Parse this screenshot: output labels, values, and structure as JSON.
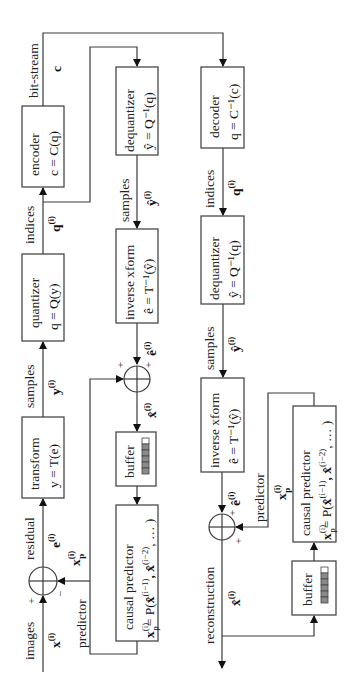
{
  "encoder": {
    "input": {
      "label": "images",
      "symbol": "x",
      "sup": "(i)"
    },
    "sum": {
      "plus": "+",
      "minus": "−"
    },
    "residual": {
      "label": "residual",
      "symbol": "e",
      "sup": "(i)"
    },
    "transform": {
      "title": "transform",
      "eq": "y = T(e)"
    },
    "samples": {
      "label": "samples",
      "symbol": "y",
      "sup": "(i)"
    },
    "quantizer": {
      "title": "quantizer",
      "eq": "q = Q(y)"
    },
    "indices": {
      "label": "indices",
      "symbol": "q",
      "sup": "(i)"
    },
    "encoder_box": {
      "title": "encoder",
      "eq": "c = C(q)"
    },
    "bitstream": {
      "label": "bit-stream",
      "symbol": "c"
    },
    "dequantizer": {
      "title": "dequantizer",
      "eq": "ŷ = Q⁻¹(q)"
    },
    "dq_samples": {
      "label": "samples",
      "symbol": "ŷ",
      "sup": "(i)"
    },
    "inverse": {
      "title": "inverse xform",
      "eq": "ê = T⁻¹(ŷ)"
    },
    "inv_out": {
      "symbol": "ê",
      "sup": "(i)"
    },
    "sum2": {
      "plus_a": "+",
      "plus_b": "+"
    },
    "recon": {
      "symbol": "x̂",
      "sup": "(i)"
    },
    "buffer": {
      "title": "buffer"
    },
    "predictor_box": {
      "title": "causal predictor",
      "eq": "x_p = P(x̂, x̂, …)",
      "eq_lhs": "x",
      "eq_lhs_sup": "(i)",
      "eq_lhs_sub": "p",
      "eq_rhs": "= P(",
      "arg1": "x̂",
      "arg1_sup": "(i−1)",
      "arg2": ", x̂",
      "arg2_sup": "(i−2)",
      "tail": ", … )"
    },
    "predictor": {
      "label": "predictor",
      "symbol": "x",
      "sub": "p",
      "sup": "(i)"
    }
  },
  "decoder": {
    "decoder_box": {
      "title": "decoder",
      "eq": "q = C⁻¹(c)"
    },
    "indices": {
      "label": "indices",
      "symbol": "q",
      "sup": "(i)"
    },
    "dequantizer": {
      "title": "dequantizer",
      "eq": "ŷ = Q⁻¹(q)"
    },
    "samples": {
      "label": "samples",
      "symbol": "ŷ",
      "sup": "(i)"
    },
    "inverse": {
      "title": "inverse xform",
      "eq": "ê = T⁻¹(ŷ)"
    },
    "inv_out": {
      "symbol": "ê",
      "sup": "(i)"
    },
    "sum": {
      "plus_a": "+",
      "plus_b": "+"
    },
    "predictor": {
      "label": "predictor",
      "symbol": "x",
      "sub": "p",
      "sup": "(i)"
    },
    "predictor_box": {
      "title": "causal predictor",
      "eq_lhs": "x",
      "eq_lhs_sup": "(i)",
      "eq_lhs_sub": "p",
      "eq_rhs": "= P(",
      "arg1": "x̂",
      "arg1_sup": "(i−1)",
      "arg2": ", x̂",
      "arg2_sup": "(i−2)",
      "tail": ", … )"
    },
    "buffer": {
      "title": "buffer"
    },
    "output": {
      "label": "reconstruction",
      "symbol": "x̂",
      "sup": "(i)"
    }
  },
  "colors": {
    "line": "#3a3a3a",
    "cell_fill": "#8a8a8a",
    "cell_empty": "#ffffff"
  }
}
